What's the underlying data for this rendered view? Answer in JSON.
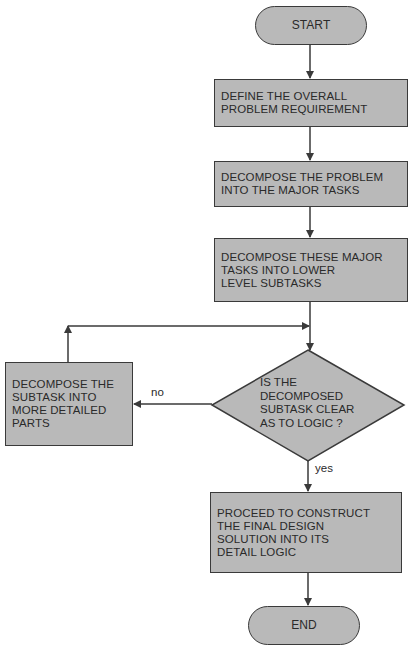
{
  "diagram": {
    "type": "flowchart",
    "colors": {
      "fill": "#b9b9b9",
      "stroke": "#3a3a3a",
      "background": "#ffffff"
    },
    "nodes": [
      {
        "id": "start",
        "shape": "terminator",
        "text": "START"
      },
      {
        "id": "define",
        "shape": "process",
        "text": "DEFINE THE OVERALL\nPROBLEM REQUIREMENT"
      },
      {
        "id": "decompose_major",
        "shape": "process",
        "text": "DECOMPOSE THE PROBLEM\nINTO THE MAJOR TASKS"
      },
      {
        "id": "decompose_lower",
        "shape": "process",
        "text": "DECOMPOSE THESE MAJOR\nTASKS INTO LOWER\nLEVEL SUBTASKS"
      },
      {
        "id": "decision",
        "shape": "decision",
        "text": "IS THE\nDECOMPOSED\nSUBTASK CLEAR\nAS TO LOGIC ?"
      },
      {
        "id": "decompose_detail",
        "shape": "process",
        "text": "DECOMPOSE THE\nSUBTASK INTO\nMORE DETAILED\nPARTS"
      },
      {
        "id": "construct",
        "shape": "process",
        "text": "PROCEED TO CONSTRUCT\nTHE FINAL DESIGN\nSOLUTION INTO ITS\nDETAIL LOGIC"
      },
      {
        "id": "end",
        "shape": "terminator",
        "text": "END"
      }
    ],
    "edge_labels": {
      "no": "no",
      "yes": "yes"
    },
    "edges": [
      {
        "from": "start",
        "to": "define"
      },
      {
        "from": "define",
        "to": "decompose_major"
      },
      {
        "from": "decompose_major",
        "to": "decompose_lower"
      },
      {
        "from": "decompose_lower",
        "to": "decision"
      },
      {
        "from": "decision",
        "to": "decompose_detail",
        "label": "no"
      },
      {
        "from": "decompose_detail",
        "to": "decision"
      },
      {
        "from": "decision",
        "to": "construct",
        "label": "yes"
      },
      {
        "from": "construct",
        "to": "end"
      }
    ]
  }
}
